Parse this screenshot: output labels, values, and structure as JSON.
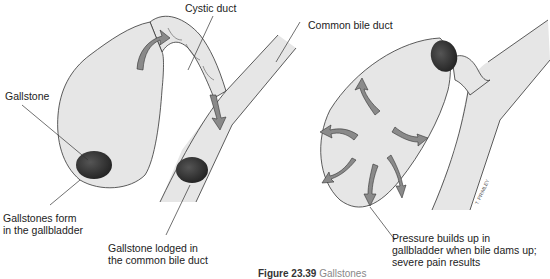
{
  "figure": {
    "caption_number": "Figure 23.39",
    "caption_text": "Gallstones"
  },
  "labels": {
    "cystic_duct": "Cystic duct",
    "common_bile_duct": "Common bile duct",
    "gallstone": "Gallstone",
    "gallstones_form_line1": "Gallstones form",
    "gallstones_form_line2": "in the gallbladder",
    "lodged_line1": "Gallstone lodged in",
    "lodged_line2": "the common bile duct",
    "pressure_line1": "Pressure builds up in",
    "pressure_line2": "gallbladder when bile dams up;",
    "pressure_line3": "severe pain results",
    "signature": "T. PRIMLEY"
  },
  "colors": {
    "organ_fill": "#e6e6e6",
    "outline": "#333333",
    "stone": "#2e2e2e",
    "arrow_fill": "#8a8a8a",
    "leader_line": "#333333"
  }
}
